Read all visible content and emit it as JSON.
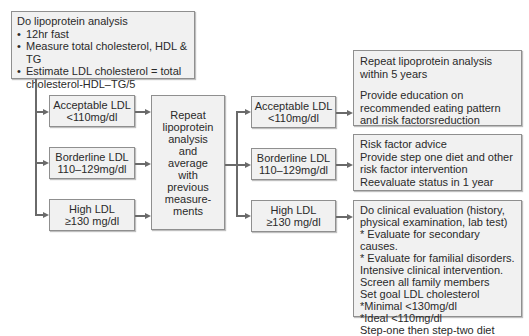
{
  "top_box": {
    "title": "Do lipoprotein analysis",
    "bullets": [
      "12hr fast",
      "Measure total cholesterol, HDL & TG",
      "Estimate LDL cholesterol = total cholesterol-HDL–TG/5"
    ]
  },
  "left_column": [
    {
      "line1": "Acceptable LDL",
      "line2": "<110mg/dl"
    },
    {
      "line1": "Borderline LDL",
      "line2": "110–129mg/dl"
    },
    {
      "line1": "High LDL",
      "line2": "≥130 mg/dl"
    }
  ],
  "middle_box": {
    "lines": [
      "Repeat",
      "lipoprotein",
      "analysis",
      "and",
      "average",
      "with",
      "previous",
      "measure-",
      "ments"
    ]
  },
  "second_column": [
    {
      "line1": "Acceptable LDL",
      "line2": "<110mg/dl"
    },
    {
      "line1": "Borderline LDL",
      "line2": "110–129mg/dl"
    },
    {
      "line1": "High LDL",
      "line2": "≥130 mg/dl"
    }
  ],
  "right_column": {
    "acceptable": {
      "para1": "Repeat lipoprotein analysis within 5 years",
      "para2": "Provide education on recommended eating pattern and risk factorsreduction"
    },
    "borderline": {
      "lines": [
        "Risk factor advice",
        "Provide step one diet and other risk factor intervention",
        "Reevaluate status in 1 year"
      ]
    },
    "high": {
      "lines": [
        "Do clinical evaluation (history, physical examination, lab test)",
        "* Evaluate for secondary causes.",
        "* Evaluate for familial disorders.",
        "Intensive  clinical intervention.",
        "Screen all family members",
        "Set goal LDL cholesterol",
        "*Minimal <130mg/dl",
        "*Ideal <110mg/dl",
        "Step-one then step-two diet"
      ]
    }
  },
  "colors": {
    "box_fill": "#f1f1f1",
    "box_border": "#8f8f8f",
    "connector": "#6a6a6a",
    "text": "#2a2a2a"
  }
}
